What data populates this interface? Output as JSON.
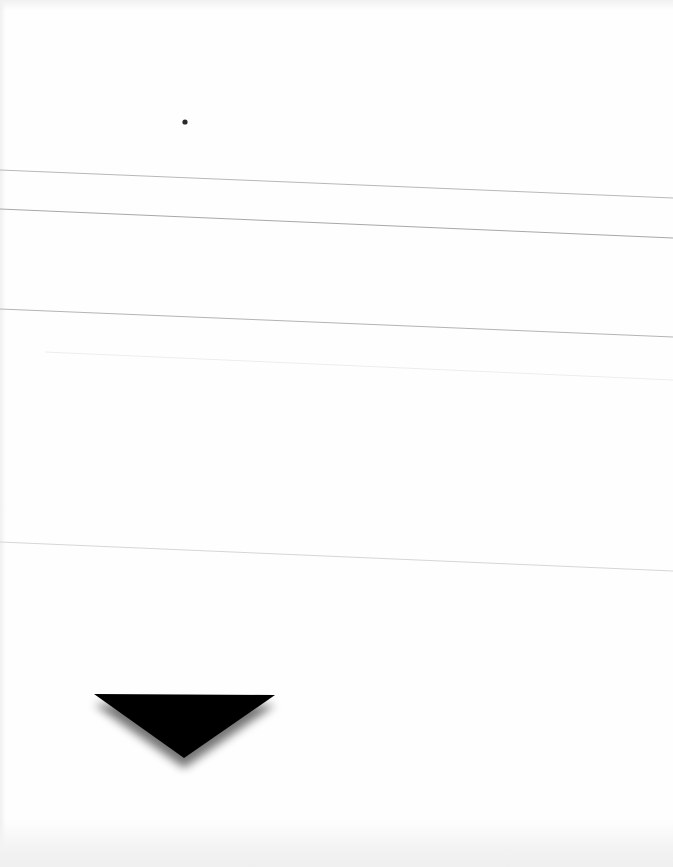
{
  "page": {
    "background": "#fefefe",
    "type": "scanned blank form page"
  },
  "dot": {
    "cx": 185,
    "cy": 122,
    "r": 2.6,
    "color": "#2a2a2a"
  },
  "rules": [
    {
      "x1": 0,
      "y1": 170,
      "x2": 673,
      "y2": 198,
      "color": "#b8b8b8",
      "width": 1
    },
    {
      "x1": 0,
      "y1": 209,
      "x2": 673,
      "y2": 238,
      "color": "#a8a8a8",
      "width": 1
    },
    {
      "x1": 0,
      "y1": 309,
      "x2": 673,
      "y2": 337,
      "color": "#b4b4b4",
      "width": 1
    },
    {
      "x1": 45,
      "y1": 352,
      "x2": 673,
      "y2": 380,
      "color": "#ededed",
      "width": 1
    },
    {
      "x1": 0,
      "y1": 542,
      "x2": 673,
      "y2": 571,
      "color": "#d6d6d6",
      "width": 1
    }
  ],
  "triangle": {
    "points": "94,694 275,695 184,758",
    "fill": "#000000",
    "shadow_color": "#000000",
    "shadow_opacity": 0.55,
    "shadow_dy": 10,
    "shadow_blur": 5
  }
}
